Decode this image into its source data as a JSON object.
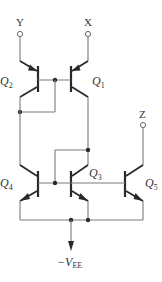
{
  "diagram": {
    "type": "BJT current mirror circuit",
    "terminals": {
      "y": "Y",
      "x": "X",
      "z": "Z"
    },
    "transistors": [
      {
        "name": "Q",
        "sub": "1",
        "type": "PNP"
      },
      {
        "name": "Q",
        "sub": "2",
        "type": "PNP"
      },
      {
        "name": "Q",
        "sub": "3",
        "type": "NPN"
      },
      {
        "name": "Q",
        "sub": "4",
        "type": "NPN"
      },
      {
        "name": "Q",
        "sub": "5",
        "type": "NPN"
      }
    ],
    "supply": {
      "prefix": "−V",
      "sub": "EE"
    },
    "colors": {
      "wire": "#7a7a7a",
      "device": "#2a2a2a",
      "background": "#ffffff"
    }
  }
}
